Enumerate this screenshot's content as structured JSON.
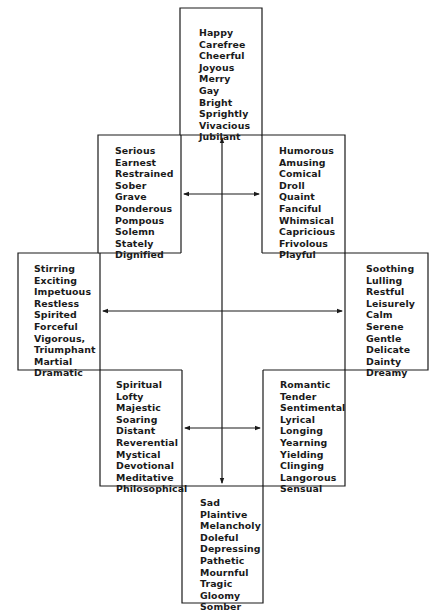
{
  "diagram": {
    "type": "mood adjective cross (Hevner-style circle of adjectives)",
    "groups": {
      "top": [
        "Happy",
        "Carefree",
        "Cheerful",
        "Joyous",
        "Merry",
        "Gay",
        "Bright",
        "Sprightly",
        "Vivacious",
        "Jubilant"
      ],
      "upper_left": [
        "Serious",
        "Earnest",
        "Restrained",
        "Sober",
        "Grave",
        "Ponderous",
        "Pompous",
        "Solemn",
        "Stately",
        "Dignified"
      ],
      "upper_right": [
        "Humorous",
        "Amusing",
        "Comical",
        "Droll",
        "Quaint",
        "Fanciful",
        "Whimsical",
        "Capricious",
        "Frivolous",
        "Playful"
      ],
      "left": [
        "Stirring",
        "Exciting",
        "Impetuous",
        "Restless",
        "Spirited",
        "Forceful",
        "Vigorous,",
        "Triumphant",
        "Martial",
        "Dramatic"
      ],
      "right": [
        "Soothing",
        "Lulling",
        "Restful",
        "Leisurely",
        "Calm",
        "Serene",
        "Gentle",
        "Delicate",
        "Dainty",
        "Dreamy"
      ],
      "lower_left": [
        "Spiritual",
        "Lofty",
        "Majestic",
        "Soaring",
        "Distant",
        "Reverential",
        "Mystical",
        "Devotional",
        "Meditative",
        "Philosophical"
      ],
      "lower_right": [
        "Romantic",
        "Tender",
        "Sentimental",
        "Lyrical",
        "Longing",
        "Yearning",
        "Yielding",
        "Clinging",
        "Langorous",
        "Sensual"
      ],
      "bottom": [
        "Sad",
        "Plaintive",
        "Melancholy",
        "Doleful",
        "Depressing",
        "Pathetic",
        "Mournful",
        "Tragic",
        "Gloomy",
        "Somber"
      ]
    },
    "arrows": [
      {
        "name": "vertical-axis",
        "direction": "both",
        "connects": [
          "top",
          "bottom"
        ]
      },
      {
        "name": "horizontal-axis",
        "direction": "both",
        "connects": [
          "left",
          "right"
        ]
      },
      {
        "name": "upper-diagonal-pair",
        "direction": "both",
        "connects": [
          "upper_left",
          "upper_right"
        ]
      },
      {
        "name": "lower-diagonal-pair",
        "direction": "both",
        "connects": [
          "lower_left",
          "lower_right"
        ]
      }
    ],
    "colors": {
      "line": "#1a1a1a",
      "text": "#1a1a1a",
      "background": "#ffffff"
    }
  }
}
